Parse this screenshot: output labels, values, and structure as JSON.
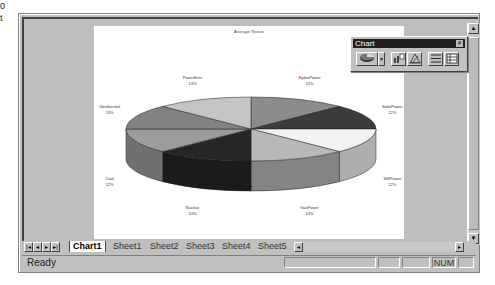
{
  "edge_text": [
    "0",
    "t"
  ],
  "chart_toolbar": {
    "title": "Chart",
    "close_icon": "close-icon",
    "buttons": [
      {
        "name": "chart-type-button",
        "icon": "pie-chart-icon"
      },
      {
        "name": "chart-type-dropdown",
        "icon": "chevron-down-icon"
      },
      {
        "name": "legend-button",
        "icon": "legend-icon"
      },
      {
        "name": "data-table-button",
        "icon": "data-table-icon"
      },
      {
        "name": "by-row-button",
        "icon": "by-row-icon"
      },
      {
        "name": "by-column-button",
        "icon": "by-column-icon"
      }
    ]
  },
  "chart_data": {
    "type": "pie",
    "style": "3d",
    "title": "Average Ratios",
    "categories": [
      "HydroPower",
      "SolarPower",
      "WillPower",
      "GasPower",
      "Nuclear",
      "Coal",
      "Geothermal",
      "PowerEver"
    ],
    "values": [
      12.5,
      12.5,
      12.5,
      12.5,
      12.5,
      12.5,
      12.5,
      12.5
    ],
    "data_labels": [
      "12%",
      "12%",
      "12%",
      "13%",
      "13%",
      "12%",
      "13%",
      "13%"
    ],
    "colors": [
      "#8c8c8c",
      "#3c3c3c",
      "#f2f2f2",
      "#b8b8b8",
      "#262626",
      "#9c9c9c",
      "#828282",
      "#c4c4c4"
    ],
    "legend": "none"
  },
  "sheet_tabs": [
    "Chart1",
    "Sheet1",
    "Sheet2",
    "Sheet3",
    "Sheet4",
    "Sheet5"
  ],
  "active_tab": "Chart1",
  "nav_buttons": [
    "|◂",
    "◂",
    "▸",
    "▸|"
  ],
  "status": {
    "text": "Ready",
    "num": "NUM"
  },
  "scroll": {
    "up": "▲",
    "down": "▼",
    "left": "◂",
    "right": "▸"
  }
}
